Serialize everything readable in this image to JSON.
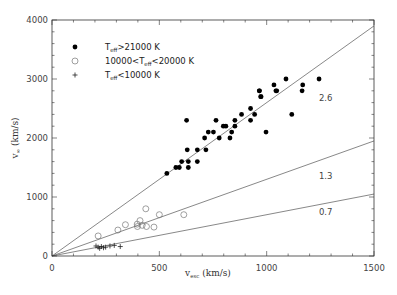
{
  "chart_data": {
    "type": "scatter",
    "title": "",
    "xlabel": "v_esc (km/s)",
    "ylabel": "v_∞ (km/s)",
    "xlim": [
      0,
      1500
    ],
    "ylim": [
      0,
      4000
    ],
    "x_ticks": [
      0,
      500,
      1000,
      1500
    ],
    "y_ticks": [
      0,
      1000,
      2000,
      3000,
      4000
    ],
    "grid": false,
    "legend_position": "upper-left",
    "series": [
      {
        "name": "T_eff>21000 K",
        "marker": "filled-circle",
        "points": [
          [
            535,
            1400
          ],
          [
            577,
            1500
          ],
          [
            593,
            1500
          ],
          [
            604,
            1600
          ],
          [
            635,
            1600
          ],
          [
            635,
            1500
          ],
          [
            630,
            1800
          ],
          [
            677,
            1800
          ],
          [
            717,
            1800
          ],
          [
            677,
            1600
          ],
          [
            627,
            2300
          ],
          [
            764,
            2300
          ],
          [
            798,
            2200
          ],
          [
            810,
            2200
          ],
          [
            852,
            2300
          ],
          [
            883,
            2400
          ],
          [
            925,
            2500
          ],
          [
            944,
            2400
          ],
          [
            925,
            2300
          ],
          [
            852,
            2200
          ],
          [
            837,
            2100
          ],
          [
            728,
            2100
          ],
          [
            752,
            2100
          ],
          [
            711,
            2000
          ],
          [
            779,
            2000
          ],
          [
            829,
            2000
          ],
          [
            997,
            2100
          ],
          [
            966,
            2800
          ],
          [
            974,
            2700
          ],
          [
            1047,
            2800
          ],
          [
            1090,
            3000
          ],
          [
            1034,
            2900
          ],
          [
            1043,
            2800
          ],
          [
            966,
            2800
          ],
          [
            972,
            2700
          ],
          [
            1168,
            2900
          ],
          [
            1165,
            2800
          ],
          [
            1244,
            3000
          ],
          [
            1117,
            2400
          ]
        ]
      },
      {
        "name": "10000<T_eff<20000 K",
        "marker": "open-circle",
        "points": [
          [
            215,
            340
          ],
          [
            307,
            440
          ],
          [
            342,
            530
          ],
          [
            398,
            500
          ],
          [
            410,
            600
          ],
          [
            420,
            520
          ],
          [
            437,
            800
          ],
          [
            440,
            500
          ],
          [
            475,
            490
          ],
          [
            500,
            700
          ],
          [
            614,
            700
          ],
          [
            397,
            540
          ]
        ]
      },
      {
        "name": "T_eff<10000 K",
        "marker": "plus",
        "points": [
          [
            205,
            170
          ],
          [
            215,
            150
          ],
          [
            222,
            130
          ],
          [
            230,
            160
          ],
          [
            240,
            140
          ],
          [
            250,
            150
          ],
          [
            270,
            170
          ],
          [
            290,
            180
          ],
          [
            318,
            160
          ]
        ]
      }
    ],
    "reference_lines": [
      {
        "label": "2.6",
        "slope": 2.6
      },
      {
        "label": "1.3",
        "slope": 1.3
      },
      {
        "label": "0.7",
        "slope": 0.7
      }
    ]
  },
  "axes": {
    "x_tick_labels": [
      "0",
      "500",
      "1000",
      "1500"
    ],
    "y_tick_labels": [
      "0",
      "1000",
      "2000",
      "3000",
      "4000"
    ],
    "x_label_main": "v",
    "x_label_sub": "esc",
    "x_label_unit": " (km/s)",
    "y_label_main": "v",
    "y_label_sub": "∞",
    "y_label_unit": " (km/s)"
  },
  "legend": [
    {
      "pre": "T",
      "sub": "eff",
      "post": ">21000 K"
    },
    {
      "pre": "10000<T",
      "sub": "eff",
      "post": "<20000 K"
    },
    {
      "pre": "T",
      "sub": "eff",
      "post": "<10000 K"
    }
  ],
  "colors": {
    "axis": "#333333",
    "line": "#555555",
    "filled_marker": "#000000",
    "open_marker": "#777777",
    "plus_marker": "#222222"
  }
}
